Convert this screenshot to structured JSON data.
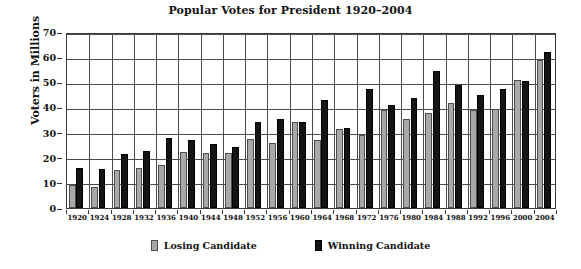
{
  "chart_data": {
    "type": "bar",
    "title": "Popular Votes for President 1920–2004",
    "xlabel": "",
    "ylabel": "Voters in Millions",
    "ylim": [
      0,
      70
    ],
    "ytick_step": 10,
    "yticks": [
      0,
      10,
      20,
      30,
      40,
      50,
      60,
      70
    ],
    "grid": true,
    "legend_position": "bottom",
    "categories": [
      "1920",
      "1924",
      "1928",
      "1932",
      "1936",
      "1940",
      "1944",
      "1948",
      "1952",
      "1956",
      "1960",
      "1964",
      "1968",
      "1972",
      "1976",
      "1980",
      "1984",
      "1988",
      "1992",
      "1996",
      "2000",
      "2004"
    ],
    "series": [
      {
        "name": "Losing Candidate",
        "color": "#a8a8a8",
        "values": [
          9.1,
          8.4,
          15.0,
          15.8,
          17.0,
          22.3,
          22.0,
          22.0,
          27.3,
          26.0,
          34.2,
          27.2,
          31.3,
          29.2,
          39.1,
          35.5,
          37.6,
          41.8,
          39.1,
          39.2,
          51.0,
          59.0
        ]
      },
      {
        "name": "Winning Candidate",
        "color": "#141414",
        "values": [
          16.1,
          15.7,
          21.4,
          22.8,
          27.8,
          27.2,
          25.6,
          24.2,
          34.1,
          35.6,
          34.2,
          43.1,
          31.8,
          47.2,
          40.8,
          43.9,
          54.5,
          48.9,
          44.9,
          47.4,
          50.5,
          62.0
        ]
      }
    ]
  },
  "legend": {
    "losing_label": "Losing Candidate",
    "winning_label": "Winning Candidate"
  }
}
